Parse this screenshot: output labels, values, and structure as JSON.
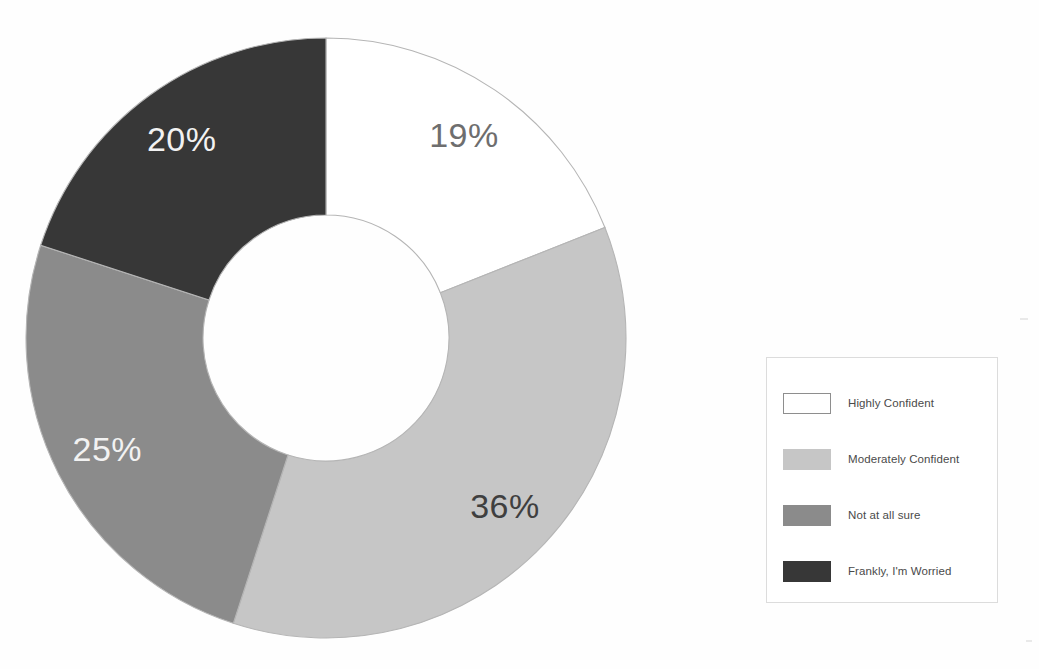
{
  "title": "",
  "chart_data": {
    "type": "pie",
    "variant": "donut",
    "title": "",
    "subtitle": "",
    "xlabel": "",
    "ylabel": "",
    "grid": false,
    "legend_position": "right",
    "hole_ratio": 0.41,
    "start_angle_deg": 0,
    "direction": "clockwise",
    "categories": [
      "Highly Confident",
      "Moderately Confident",
      "Not at all sure",
      "Frankly, I'm Worried"
    ],
    "values": [
      19,
      36,
      25,
      20
    ],
    "value_unit": "%",
    "data_labels": [
      "19%",
      "36%",
      "25%",
      "20%"
    ],
    "colors": [
      "#ffffff",
      "#c6c6c6",
      "#8b8b8b",
      "#373737"
    ],
    "label_text_colors": [
      "#6e6e6e",
      "#3f3f3f",
      "#f2f2f2",
      "#f2f2f2"
    ],
    "slice_border_color": "#b5b5b5",
    "series": [
      {
        "name": "Confidence level",
        "values": [
          19,
          36,
          25,
          20
        ]
      }
    ]
  },
  "slices": [
    {
      "label": "19%",
      "value": 19,
      "category": "Highly Confident",
      "fill": "#ffffff",
      "text": "#6e6e6e"
    },
    {
      "label": "36%",
      "value": 36,
      "category": "Moderately Confident",
      "fill": "#c6c6c6",
      "text": "#3f3f3f"
    },
    {
      "label": "25%",
      "value": 25,
      "category": "Not at all sure",
      "fill": "#8b8b8b",
      "text": "#f2f2f2"
    },
    {
      "label": "20%",
      "value": 20,
      "category": "Frankly, I'm Worried",
      "fill": "#373737",
      "text": "#f2f2f2"
    }
  ],
  "legend": {
    "items": [
      {
        "label": "Highly Confident",
        "swatch": "#ffffff",
        "swatch_border": "#8e8e8e"
      },
      {
        "label": "Moderately Confident",
        "swatch": "#c6c6c6",
        "swatch_border": "#c6c6c6"
      },
      {
        "label": "Not at all sure",
        "swatch": "#8b8b8b",
        "swatch_border": "#8b8b8b"
      },
      {
        "label": "Frankly, I'm Worried",
        "swatch": "#373737",
        "swatch_border": "#373737"
      }
    ]
  }
}
